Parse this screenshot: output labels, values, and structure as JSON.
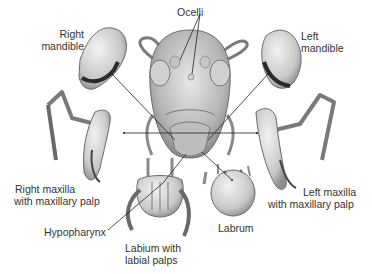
{
  "diagram": {
    "labels": {
      "ocelli": "Ocelli",
      "right_mandible_1": "Right",
      "right_mandible_2": "mandible",
      "left_mandible_1": "Left",
      "left_mandible_2": "mandible",
      "right_maxilla_1": "Right maxilla",
      "right_maxilla_2": "with maxillary palp",
      "left_maxilla_1": "Left maxilla",
      "left_maxilla_2": "with maxillary palp",
      "hypopharynx": "Hypopharynx",
      "labium_1": "Labium with",
      "labium_2": "labial palps",
      "labrum": "Labrum"
    },
    "colors": {
      "background": "#ffffff",
      "text": "#333333",
      "leader_line": "#222222",
      "illustration_light": "#e4e4e4",
      "illustration_mid": "#a8a8a8",
      "illustration_dark": "#3a3a3a"
    }
  }
}
